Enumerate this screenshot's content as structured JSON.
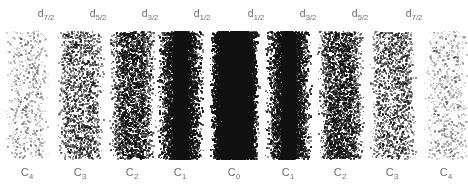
{
  "figure": {
    "title": "",
    "background_color": "#ffffff",
    "dot_color": "#111111",
    "label_color": "#6d6d6d",
    "width": 468,
    "height": 192
  },
  "top_labels": [
    {
      "base": "d",
      "sub": "7/2",
      "x": 46
    },
    {
      "base": "d",
      "sub": "5/2",
      "x": 98
    },
    {
      "base": "d",
      "sub": "3/2",
      "x": 150
    },
    {
      "base": "d",
      "sub": "1/2",
      "x": 202
    },
    {
      "base": "d",
      "sub": "1/2",
      "x": 256
    },
    {
      "base": "d",
      "sub": "3/2",
      "x": 308
    },
    {
      "base": "d",
      "sub": "5/2",
      "x": 360
    },
    {
      "base": "d",
      "sub": "7/2",
      "x": 414
    }
  ],
  "bottom_labels": [
    {
      "base": "C",
      "sub": "4",
      "x": 27
    },
    {
      "base": "C",
      "sub": "3",
      "x": 80
    },
    {
      "base": "C",
      "sub": "2",
      "x": 132
    },
    {
      "base": "C",
      "sub": "1",
      "x": 180
    },
    {
      "base": "C",
      "sub": "0",
      "x": 234
    },
    {
      "base": "C",
      "sub": "1",
      "x": 288
    },
    {
      "base": "C",
      "sub": "2",
      "x": 340
    },
    {
      "base": "C",
      "sub": "3",
      "x": 392
    },
    {
      "base": "C",
      "sub": "4",
      "x": 446
    }
  ],
  "chart_data": {
    "type": "scatter",
    "title": "",
    "xlabel": "",
    "ylabel": "",
    "plot_area": {
      "x0": 4,
      "y0": 31,
      "x1": 464,
      "y1": 158
    },
    "grid": false,
    "legend": null,
    "categories": [
      "C4",
      "C3",
      "C2",
      "C1",
      "C0",
      "C1",
      "C2",
      "C3",
      "C4"
    ],
    "series": [
      {
        "name": "relative_density",
        "values": [
          0.1,
          0.26,
          0.42,
          0.72,
          1.0,
          0.72,
          0.42,
          0.26,
          0.1
        ]
      }
    ],
    "columns": [
      {
        "label": "C4",
        "orbital": "d7/2",
        "center_x": 27,
        "half_width": 22,
        "core_half_width": 13,
        "density": 0.1,
        "core_density": 0.16,
        "dot_alpha": 0.3,
        "dot_size": 1.5
      },
      {
        "label": "C3",
        "orbital": "d5/2",
        "center_x": 80,
        "half_width": 23,
        "core_half_width": 14,
        "density": 0.26,
        "core_density": 0.4,
        "dot_alpha": 0.55,
        "dot_size": 1.6
      },
      {
        "label": "C2",
        "orbital": "d3/2",
        "center_x": 132,
        "half_width": 23,
        "core_half_width": 12,
        "density": 0.42,
        "core_density": 0.62,
        "dot_alpha": 0.7,
        "dot_size": 1.6
      },
      {
        "label": "C1",
        "orbital": "d1/2",
        "center_x": 180,
        "half_width": 23,
        "core_half_width": 7,
        "density": 0.72,
        "core_density": 1.0,
        "dot_alpha": 0.88,
        "dot_size": 1.7
      },
      {
        "label": "C0",
        "orbital": "",
        "center_x": 234,
        "half_width": 24,
        "core_half_width": 13,
        "density": 1.0,
        "core_density": 1.0,
        "dot_alpha": 1.0,
        "dot_size": 1.8
      },
      {
        "label": "C1",
        "orbital": "d1/2",
        "center_x": 288,
        "half_width": 23,
        "core_half_width": 7,
        "density": 0.72,
        "core_density": 1.0,
        "dot_alpha": 0.88,
        "dot_size": 1.7
      },
      {
        "label": "C2",
        "orbital": "d3/2",
        "center_x": 340,
        "half_width": 23,
        "core_half_width": 12,
        "density": 0.42,
        "core_density": 0.62,
        "dot_alpha": 0.7,
        "dot_size": 1.6
      },
      {
        "label": "C3",
        "orbital": "d5/2",
        "center_x": 392,
        "half_width": 23,
        "core_half_width": 14,
        "density": 0.26,
        "core_density": 0.4,
        "dot_alpha": 0.55,
        "dot_size": 1.6
      },
      {
        "label": "C4",
        "orbital": "d7/2",
        "center_x": 446,
        "half_width": 22,
        "core_half_width": 13,
        "density": 0.1,
        "core_density": 0.16,
        "dot_alpha": 0.3,
        "dot_size": 1.5
      }
    ]
  }
}
